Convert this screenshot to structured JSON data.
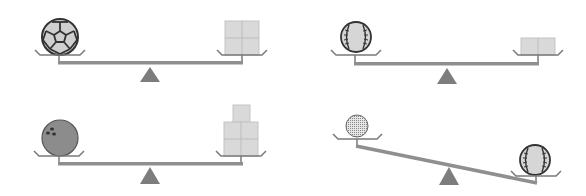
{
  "figure": {
    "colors": {
      "beam": "#8f8f8f",
      "tray": "#7a7a7a",
      "fulcrum": "#7d7d7d",
      "cube_fill": "#d9d9d9",
      "cube_line": "#bdbdbd",
      "ball_outline": "#3a3a3a",
      "ball_light": "#cfcfcf",
      "bowling_fill": "#8c8c8c"
    },
    "scales": [
      {
        "id": "scale-1",
        "left_item": "soccer-ball",
        "right_item": "cubes",
        "cube_count": 4,
        "state": "balanced"
      },
      {
        "id": "scale-2",
        "left_item": "baseball",
        "right_item": "cubes",
        "cube_count": 2,
        "state": "balanced"
      },
      {
        "id": "scale-3",
        "left_item": "bowling-ball",
        "right_item": "cubes",
        "cube_count": 5,
        "state": "balanced"
      },
      {
        "id": "scale-4",
        "left_item": "golf-ball",
        "right_item": "baseball",
        "cube_count": 0,
        "state": "tilted-right-heavier"
      }
    ]
  }
}
